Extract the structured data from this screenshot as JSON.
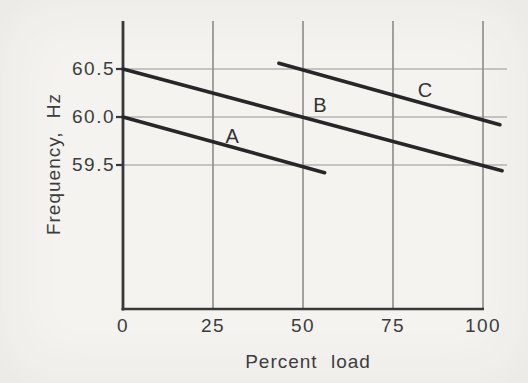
{
  "figure": {
    "background_color": "#f4f3f0",
    "line_color": "#272727",
    "axis_color": "#383838",
    "vgrid_color": "#7d7d7d",
    "hgrid_color": "#949494",
    "text_color": "#3c3c3c"
  },
  "chart_data": {
    "type": "line",
    "title": "",
    "xlabel": "Percent load",
    "ylabel": "Frequency, Hz",
    "xlim": [
      0,
      106.7
    ],
    "ylim": [
      58.0,
      61.0
    ],
    "grid": true,
    "legend_position": "inline-labels",
    "x_ticks": [
      {
        "label": "0",
        "value": 0
      },
      {
        "label": "25",
        "value": 25
      },
      {
        "label": "50",
        "value": 50
      },
      {
        "label": "75",
        "value": 75
      },
      {
        "label": "100",
        "value": 100
      }
    ],
    "y_ticks": [
      {
        "label": "60.5",
        "value": 60.5
      },
      {
        "label": "60.0",
        "value": 60.0
      },
      {
        "label": "59.5",
        "value": 59.5
      }
    ],
    "series": [
      {
        "name": "A",
        "points": [
          [
            0,
            60.0
          ],
          [
            56,
            59.42
          ]
        ],
        "label_pos": [
          30.3,
          59.8
        ],
        "slope_hz_per_percent": -0.0104
      },
      {
        "name": "B",
        "points": [
          [
            0,
            60.5
          ],
          [
            105.3,
            59.44
          ]
        ],
        "label_pos": [
          54.7,
          60.12
        ],
        "slope_hz_per_percent": -0.0104
      },
      {
        "name": "C",
        "points": [
          [
            43.3,
            60.56
          ],
          [
            104.7,
            59.92
          ]
        ],
        "label_pos": [
          83.9,
          60.28
        ],
        "slope_hz_per_percent": -0.0104
      }
    ]
  }
}
